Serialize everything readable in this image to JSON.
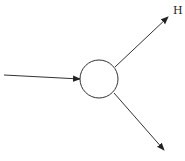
{
  "diagram": {
    "node": {
      "shape": "circle",
      "label": ""
    },
    "edges": [
      {
        "name": "input",
        "direction": "into-node",
        "label": ""
      },
      {
        "name": "output-upper",
        "direction": "out-of-node",
        "label": "H"
      },
      {
        "name": "output-lower",
        "direction": "out-of-node",
        "label": ""
      }
    ],
    "colors": {
      "stroke": "#333333",
      "background": "#ffffff"
    }
  }
}
